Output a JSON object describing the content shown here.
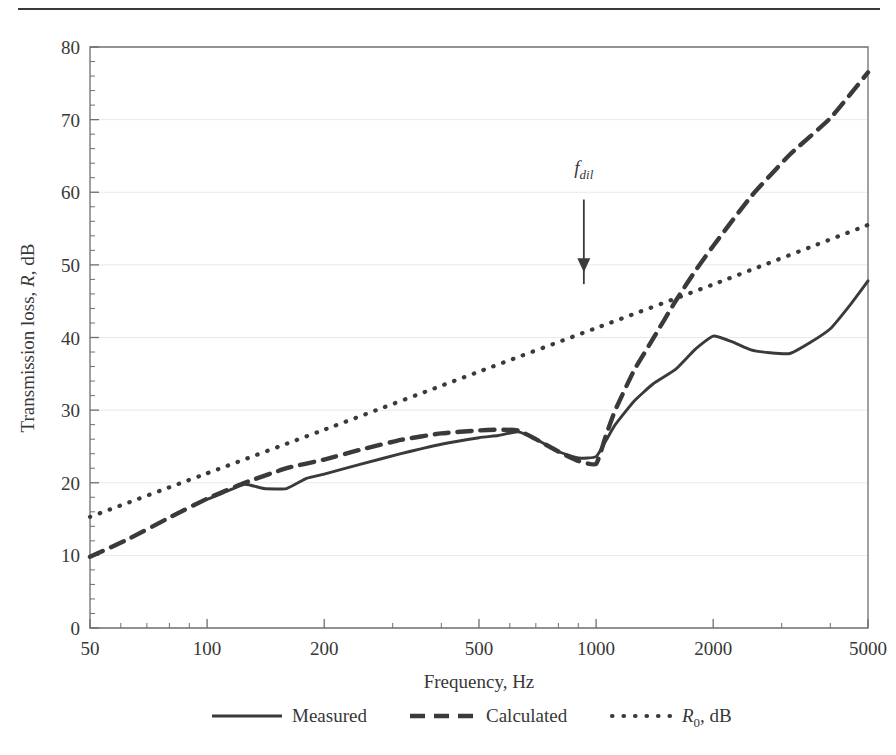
{
  "figure": {
    "top_rule": true,
    "background": "#ffffff",
    "ink_color": "#3a3a3a"
  },
  "chart_data": {
    "type": "line",
    "title": "",
    "subtitle": "",
    "xlabel": "Frequency, Hz",
    "ylabel": "Transmission loss, R, dB",
    "ylabel_parts": {
      "pre": "Transmission loss, ",
      "italic": "R",
      "post": ", dB"
    },
    "xscale": "log",
    "yscale": "linear",
    "xlim": [
      50,
      5000
    ],
    "ylim": [
      0,
      80
    ],
    "xticks": [
      50,
      100,
      200,
      500,
      1000,
      2000,
      5000
    ],
    "xtick_labels": [
      "50",
      "100",
      "200",
      "500",
      "1000",
      "2000",
      "5000"
    ],
    "yticks": [
      0,
      10,
      20,
      30,
      40,
      50,
      60,
      70,
      80
    ],
    "ytick_labels": [
      "0",
      "10",
      "20",
      "30",
      "40",
      "50",
      "60",
      "70",
      "80"
    ],
    "y_minor_step": 2,
    "grid": "faint horizontal at 10 dB steps",
    "legend_position": "below-axes",
    "series": [
      {
        "name": "Measured",
        "style": "solid",
        "x": [
          100,
          110,
          125,
          140,
          160,
          180,
          200,
          250,
          315,
          400,
          500,
          560,
          630,
          700,
          800,
          900,
          1000,
          1060,
          1120,
          1250,
          1400,
          1600,
          1800,
          2000,
          2240,
          2500,
          2800,
          3150,
          3550,
          4000,
          4500,
          5000
        ],
        "y": [
          17.7,
          18.6,
          19.8,
          19.2,
          19.2,
          20.6,
          21.2,
          22.6,
          24.0,
          25.3,
          26.2,
          26.5,
          27.0,
          26.0,
          24.3,
          23.4,
          23.6,
          25.8,
          28.0,
          31.2,
          33.6,
          35.6,
          38.4,
          40.2,
          39.4,
          38.3,
          37.9,
          37.8,
          39.3,
          41.2,
          44.5,
          47.8
        ]
      },
      {
        "name": "Calculated",
        "style": "dashed",
        "x": [
          50,
          63,
          80,
          100,
          125,
          160,
          200,
          250,
          315,
          400,
          500,
          560,
          630,
          700,
          800,
          900,
          1000,
          1060,
          1120,
          1250,
          1400,
          1600,
          1800,
          2000,
          2500,
          3150,
          4000,
          5000
        ],
        "y": [
          9.8,
          12.3,
          15.2,
          17.8,
          20.0,
          22.0,
          23.2,
          24.6,
          25.9,
          26.8,
          27.2,
          27.3,
          27.2,
          26.0,
          24.3,
          23.0,
          22.6,
          26.5,
          30.0,
          35.4,
          39.8,
          45.0,
          49.2,
          52.6,
          59.4,
          65.2,
          70.2,
          76.5
        ]
      },
      {
        "name": "R0, dB",
        "name_parts": {
          "italic": "R",
          "sub": "0",
          "post": ", dB"
        },
        "style": "dotted",
        "x": [
          50,
          100,
          200,
          500,
          1000,
          2000,
          5000
        ],
        "y": [
          15.3,
          21.3,
          27.3,
          35.3,
          41.3,
          47.3,
          55.5
        ]
      }
    ],
    "annotations": [
      {
        "name": "f_dil",
        "label_parts": {
          "italic": "f",
          "sub_italic": "dil"
        },
        "x": 930,
        "y_text": 62.5,
        "arrow_from_y": 59.0,
        "arrow_to_y": 49.0,
        "arrow": "down"
      }
    ]
  },
  "legend": {
    "items": [
      {
        "label": "Measured",
        "style": "solid"
      },
      {
        "label": "Calculated",
        "style": "dashed"
      },
      {
        "label": "R0, dB",
        "style": "dotted",
        "italic": "R",
        "sub": "0",
        "post": ", dB"
      }
    ]
  }
}
